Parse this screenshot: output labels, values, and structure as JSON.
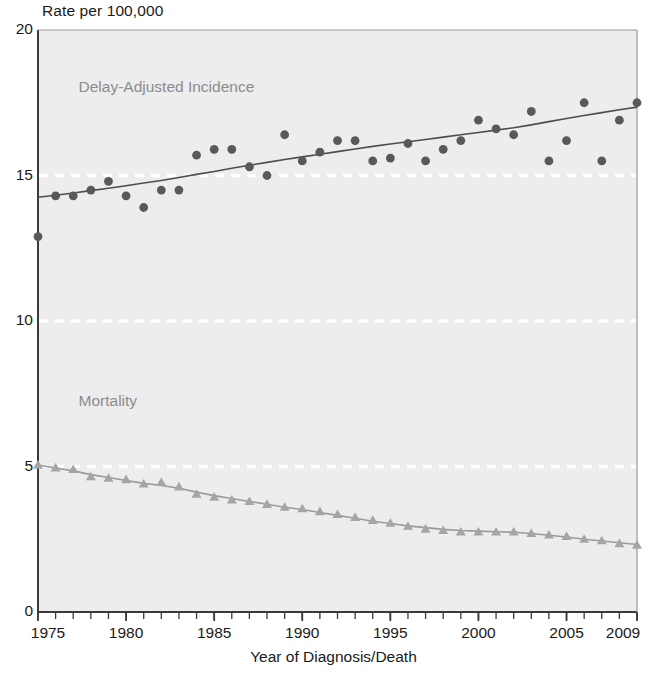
{
  "chart_data": {
    "type": "scatter",
    "title": "",
    "ylabel": "Rate per 100,000",
    "xlabel": "Year of Diagnosis/Death",
    "xlim": [
      1975,
      2009
    ],
    "ylim": [
      0,
      20
    ],
    "yticks": [
      0,
      5,
      10,
      15,
      20
    ],
    "ytick_labels": [
      "0",
      "5",
      "10",
      "15",
      "20"
    ],
    "xticks": [
      1975,
      1980,
      1985,
      1990,
      1995,
      2000,
      2005,
      2009
    ],
    "xtick_labels": [
      "1975",
      "1980",
      "1985",
      "1990",
      "1995",
      "2000",
      "2005",
      "2009"
    ],
    "minor_xticks_every": 1,
    "grid": "horizontal dashed white gridlines at 5, 10, 15",
    "gridlines": [
      5,
      10,
      15
    ],
    "legend_position": "inline annotations",
    "plot_background": "#ededed",
    "series": [
      {
        "name": "Delay-Adjusted Incidence",
        "label_color": "#8c8c8c",
        "marker": "circle",
        "marker_color": "#59595b",
        "trend_line": true,
        "trend_line_color": "#4d4d4f",
        "x": [
          1975,
          1976,
          1977,
          1978,
          1979,
          1980,
          1981,
          1982,
          1983,
          1984,
          1985,
          1986,
          1987,
          1988,
          1989,
          1990,
          1991,
          1992,
          1993,
          1994,
          1995,
          1996,
          1997,
          1998,
          1999,
          2000,
          2001,
          2002,
          2003,
          2004,
          2005,
          2006,
          2007,
          2008,
          2009
        ],
        "values": [
          12.9,
          14.3,
          14.3,
          14.5,
          14.8,
          14.3,
          13.9,
          14.5,
          14.5,
          15.7,
          15.9,
          15.9,
          15.3,
          15.0,
          16.4,
          15.5,
          15.8,
          16.2,
          16.2,
          15.5,
          15.6,
          16.1,
          15.5,
          15.9,
          16.2,
          16.9,
          16.6,
          16.4,
          17.2,
          15.5,
          16.2,
          17.5,
          15.5,
          16.9,
          17.5
        ],
        "trend_values": [
          14.25,
          14.32,
          14.4,
          14.48,
          14.56,
          14.65,
          14.74,
          14.83,
          14.93,
          15.04,
          15.14,
          15.25,
          15.35,
          15.45,
          15.55,
          15.64,
          15.73,
          15.82,
          15.91,
          16.0,
          16.08,
          16.16,
          16.24,
          16.32,
          16.4,
          16.48,
          16.56,
          16.64,
          16.74,
          16.85,
          16.96,
          17.06,
          17.16,
          17.26,
          17.35
        ]
      },
      {
        "name": "Mortality",
        "label_color": "#a0a0a0",
        "marker": "triangle",
        "marker_color": "#a5a5a7",
        "trend_line": true,
        "trend_line_color": "#9b9b9d",
        "x": [
          1975,
          1976,
          1977,
          1978,
          1979,
          1980,
          1981,
          1982,
          1983,
          1984,
          1985,
          1986,
          1987,
          1988,
          1989,
          1990,
          1991,
          1992,
          1993,
          1994,
          1995,
          1996,
          1997,
          1998,
          1999,
          2000,
          2001,
          2002,
          2003,
          2004,
          2005,
          2006,
          2007,
          2008,
          2009
        ],
        "values": [
          5.05,
          4.95,
          4.9,
          4.65,
          4.6,
          4.55,
          4.4,
          4.45,
          4.3,
          4.05,
          3.95,
          3.85,
          3.8,
          3.7,
          3.6,
          3.55,
          3.45,
          3.35,
          3.25,
          3.15,
          3.05,
          2.95,
          2.85,
          2.8,
          2.75,
          2.75,
          2.75,
          2.75,
          2.7,
          2.65,
          2.6,
          2.5,
          2.45,
          2.35,
          2.3
        ],
        "trend_values": [
          5.05,
          4.95,
          4.85,
          4.72,
          4.62,
          4.52,
          4.42,
          4.35,
          4.25,
          4.12,
          4.0,
          3.9,
          3.8,
          3.7,
          3.6,
          3.52,
          3.42,
          3.32,
          3.22,
          3.12,
          3.04,
          2.96,
          2.9,
          2.84,
          2.8,
          2.78,
          2.76,
          2.74,
          2.7,
          2.64,
          2.58,
          2.5,
          2.44,
          2.38,
          2.32
        ]
      }
    ],
    "annotations": [
      {
        "text": "Delay-Adjusted Incidence",
        "x": 1977.3,
        "y": 18.0
      },
      {
        "text": "Mortality",
        "x": 1977.3,
        "y": 7.2
      }
    ]
  }
}
